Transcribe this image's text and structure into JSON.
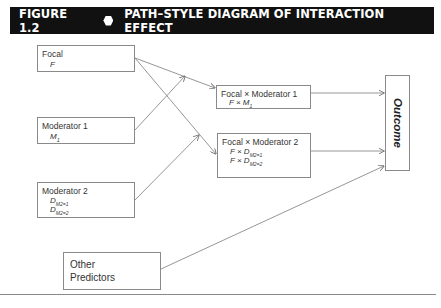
{
  "figure": {
    "number": "FIGURE 1.2",
    "marker": "hexagon",
    "title": "PATH–STYLE DIAGRAM OF INTERACTION EFFECT"
  },
  "nodes": {
    "focal": {
      "label": "Focal",
      "vars": [
        "F"
      ]
    },
    "moderator1": {
      "label": "Moderator 1",
      "vars": [
        "M1"
      ],
      "var_base": "M",
      "var_sub": "1"
    },
    "moderator2": {
      "label": "Moderator 2",
      "vars": [
        "D M2=1",
        "D M2=2"
      ],
      "var_base": "D",
      "var_subs": [
        "M2=1",
        "M2=2"
      ]
    },
    "other": {
      "label": "Other Predictors"
    },
    "fxm1": {
      "label": "Focal × Moderator 1",
      "prefix": "F × ",
      "var_base": "M",
      "var_sub": "1"
    },
    "fxm2": {
      "label": "Focal × Moderator 2",
      "prefix": "F × ",
      "var_base": "D",
      "var_subs": [
        "M2=1",
        "M2=2"
      ]
    },
    "outcome": {
      "label": "Outcome"
    }
  },
  "edges": [
    [
      "focal",
      "fxm1"
    ],
    [
      "focal",
      "fxm2"
    ],
    [
      "moderator1",
      "fxm1"
    ],
    [
      "moderator2",
      "fxm2"
    ],
    [
      "fxm1",
      "outcome"
    ],
    [
      "fxm2",
      "outcome"
    ],
    [
      "other",
      "outcome"
    ]
  ],
  "colors": {
    "header_bg": "#111111",
    "header_text": "#ffffff",
    "line": "#8a8a8a"
  }
}
